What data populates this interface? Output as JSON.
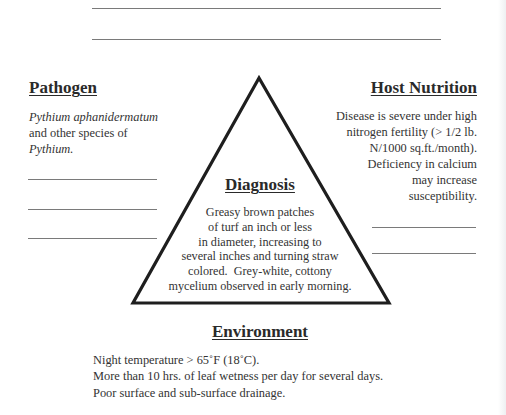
{
  "diagram": {
    "type": "disease-triangle",
    "vertices": {
      "apex": [
        259,
        77
      ],
      "bottom_left": [
        132,
        304
      ],
      "bottom_right": [
        390,
        304
      ]
    },
    "stroke_color": "#1e1e1e",
    "blank_line_color": "#7a7a7a"
  },
  "top_blank_lines": [
    {
      "x1": 92,
      "x2": 441,
      "y": 8
    },
    {
      "x1": 92,
      "x2": 441,
      "y": 39
    }
  ],
  "pathogen": {
    "heading": "Pathogen",
    "lines": [
      {
        "text": "Pythium aphanidermatum",
        "italic": true
      },
      {
        "text": "and other species of",
        "italic": false
      },
      {
        "text": "Pythium.",
        "italic": true
      }
    ],
    "blank_lines": [
      {
        "x1": 28,
        "x2": 157,
        "y": 179
      },
      {
        "x1": 28,
        "x2": 157,
        "y": 209
      },
      {
        "x1": 28,
        "x2": 157,
        "y": 238
      }
    ]
  },
  "host_nutrition": {
    "heading": "Host Nutrition",
    "lines": [
      "Disease is severe under high",
      "nitrogen fertility (> 1/2 lb.",
      "N/1000 sq.ft./month).",
      "Deficiency in calcium",
      "may increase",
      "susceptibility."
    ],
    "blank_lines": [
      {
        "x1": 372,
        "x2": 476,
        "y": 227
      },
      {
        "x1": 372,
        "x2": 476,
        "y": 253
      }
    ]
  },
  "diagnosis": {
    "heading": "Diagnosis",
    "lines": [
      "Greasy brown patches",
      "of turf an inch or less",
      "in diameter, increasing to",
      "several inches and turning straw",
      "colored.  Grey-white, cottony",
      "mycelium observed in early morning."
    ]
  },
  "environment": {
    "heading": "Environment",
    "lines": [
      "Night temperature > 65˚F (18˚C).",
      "More than 10 hrs. of leaf wetness per day for several days.",
      "Poor surface and sub-surface drainage."
    ]
  }
}
